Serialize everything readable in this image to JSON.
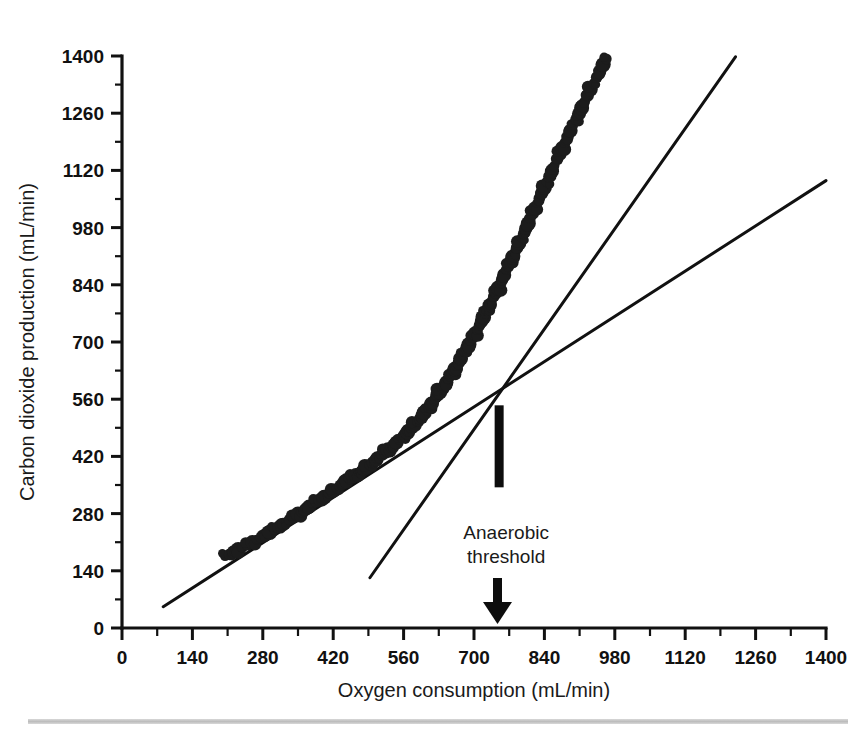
{
  "figure": {
    "caption_bar": "",
    "background_color": "#ffffff",
    "ink_color": "#111111"
  },
  "chart_data": {
    "type": "scatter",
    "title": "",
    "xlabel": "Oxygen consumption (mL/min)",
    "ylabel": "Carbon dioxide production (mL/min)",
    "xlim": [
      0,
      1400
    ],
    "ylim": [
      0,
      1400
    ],
    "xticks": [
      0,
      140,
      280,
      420,
      560,
      700,
      840,
      980,
      1120,
      1260,
      1400
    ],
    "yticks": [
      0,
      140,
      280,
      420,
      560,
      700,
      840,
      980,
      1120,
      1260,
      1400
    ],
    "xtick_labels": [
      "0",
      "140",
      "280",
      "420",
      "560",
      "700",
      "840",
      "980",
      "1120",
      "1260",
      "1400"
    ],
    "ytick_labels": [
      "0",
      "140",
      "280",
      "420",
      "560",
      "700",
      "840",
      "980",
      "1120",
      "1260",
      "1400"
    ],
    "minor_tick_step": 70,
    "grid": false,
    "legend": null,
    "series": [
      {
        "name": "VCO2 vs VO2",
        "marker": "filled-circle",
        "marker_color": "#1c1c1c",
        "points": [
          [
            205,
            176
          ],
          [
            214,
            180
          ],
          [
            222,
            186
          ],
          [
            231,
            192
          ],
          [
            240,
            198
          ],
          [
            250,
            205
          ],
          [
            259,
            210
          ],
          [
            268,
            216
          ],
          [
            277,
            222
          ],
          [
            286,
            229
          ],
          [
            294,
            234
          ],
          [
            303,
            241
          ],
          [
            311,
            247
          ],
          [
            318,
            252
          ],
          [
            326,
            258
          ],
          [
            334,
            266
          ],
          [
            342,
            272
          ],
          [
            350,
            279
          ],
          [
            357,
            284
          ],
          [
            364,
            289
          ],
          [
            372,
            297
          ],
          [
            380,
            304
          ],
          [
            386,
            309
          ],
          [
            394,
            314
          ],
          [
            402,
            320
          ],
          [
            409,
            327
          ],
          [
            414,
            331
          ],
          [
            420,
            336
          ],
          [
            427,
            342
          ],
          [
            434,
            349
          ],
          [
            441,
            356
          ],
          [
            447,
            361
          ],
          [
            453,
            365
          ],
          [
            459,
            369
          ],
          [
            465,
            374
          ],
          [
            471,
            380
          ],
          [
            476,
            384
          ],
          [
            481,
            388
          ],
          [
            487,
            394
          ],
          [
            493,
            399
          ],
          [
            499,
            405
          ],
          [
            506,
            412
          ],
          [
            512,
            418
          ],
          [
            518,
            424
          ],
          [
            524,
            431
          ],
          [
            529,
            436
          ],
          [
            535,
            442
          ],
          [
            540,
            448
          ],
          [
            546,
            454
          ],
          [
            552,
            460
          ],
          [
            558,
            468
          ],
          [
            563,
            473
          ],
          [
            568,
            479
          ],
          [
            572,
            484
          ],
          [
            577,
            490
          ],
          [
            582,
            497
          ],
          [
            587,
            505
          ],
          [
            592,
            512
          ],
          [
            597,
            520
          ],
          [
            601,
            527
          ],
          [
            606,
            534
          ],
          [
            611,
            542
          ],
          [
            615,
            549
          ],
          [
            620,
            557
          ],
          [
            624,
            564
          ],
          [
            628,
            571
          ],
          [
            632,
            578
          ],
          [
            637,
            586
          ],
          [
            641,
            594
          ],
          [
            645,
            601
          ],
          [
            649,
            609
          ],
          [
            653,
            617
          ],
          [
            658,
            626
          ],
          [
            662,
            634
          ],
          [
            666,
            642
          ],
          [
            670,
            650
          ],
          [
            674,
            659
          ],
          [
            678,
            668
          ],
          [
            682,
            677
          ],
          [
            686,
            686
          ],
          [
            690,
            694
          ],
          [
            694,
            703
          ],
          [
            698,
            712
          ],
          [
            702,
            721
          ],
          [
            706,
            730
          ],
          [
            711,
            741
          ],
          [
            715,
            751
          ],
          [
            719,
            760
          ],
          [
            723,
            770
          ],
          [
            727,
            780
          ],
          [
            731,
            790
          ],
          [
            735,
            800
          ],
          [
            740,
            812
          ],
          [
            744,
            822
          ],
          [
            748,
            832
          ],
          [
            752,
            843
          ],
          [
            756,
            853
          ],
          [
            760,
            864
          ],
          [
            765,
            876
          ],
          [
            769,
            886
          ],
          [
            773,
            897
          ],
          [
            777,
            908
          ],
          [
            782,
            920
          ],
          [
            786,
            931
          ],
          [
            790,
            942
          ],
          [
            795,
            955
          ],
          [
            799,
            966
          ],
          [
            803,
            978
          ],
          [
            808,
            990
          ],
          [
            812,
            1002
          ],
          [
            817,
            1015
          ],
          [
            821,
            1027
          ],
          [
            826,
            1040
          ],
          [
            830,
            1052
          ],
          [
            835,
            1065
          ],
          [
            840,
            1078
          ],
          [
            845,
            1092
          ],
          [
            850,
            1105
          ],
          [
            855,
            1118
          ],
          [
            860,
            1132
          ],
          [
            866,
            1147
          ],
          [
            871,
            1160
          ],
          [
            876,
            1174
          ],
          [
            881,
            1188
          ],
          [
            886,
            1202
          ],
          [
            892,
            1217
          ],
          [
            897,
            1230
          ],
          [
            903,
            1245
          ],
          [
            908,
            1258
          ],
          [
            914,
            1273
          ],
          [
            920,
            1288
          ],
          [
            926,
            1303
          ],
          [
            932,
            1318
          ],
          [
            938,
            1333
          ],
          [
            944,
            1348
          ],
          [
            950,
            1363
          ],
          [
            957,
            1379
          ],
          [
            963,
            1393
          ]
        ]
      }
    ],
    "fit_lines": [
      {
        "name": "aerobic-slope-line",
        "description": "shallow regression line (slope ~1.0, below-threshold relationship extended)",
        "x_start": 82,
        "y_start": 52,
        "x_end": 1400,
        "y_end": 1095
      },
      {
        "name": "anaerobic-slope-line",
        "description": "steep regression line (above-threshold relationship)",
        "x_start": 493,
        "y_start": 123,
        "x_end": 1220,
        "y_end": 1398
      }
    ],
    "annotations": [
      {
        "name": "anaerobic-threshold",
        "text_line_1": "Anaerobic",
        "text_line_2": "threshold",
        "x_value": 750,
        "marker_top_y": 545,
        "marker_bottom_y": 0,
        "style": "vertical-bar-above-label-and-down-arrow-below"
      }
    ],
    "breakpoint": {
      "label": "Anaerobic threshold",
      "x": 737,
      "y": 575
    }
  },
  "axes": {
    "x_title": "Oxygen consumption (mL/min)",
    "y_title": "Carbon dioxide production (mL/min)"
  },
  "annotation": {
    "line1": "Anaerobic",
    "line2": "threshold"
  }
}
